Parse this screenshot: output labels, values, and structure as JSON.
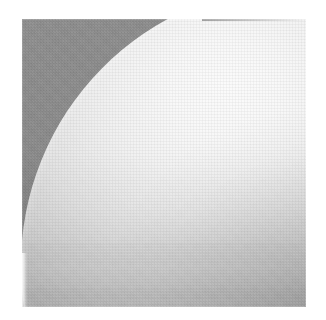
{
  "image": {
    "subject": "sphere",
    "caption": "",
    "medium": "halftone-print-scan",
    "frame": {
      "left_px": 22,
      "top_px": 19,
      "width_px": 284,
      "height_px": 288
    },
    "canvas": {
      "width_px": 326,
      "height_px": 320,
      "background_color": "#ffffff"
    },
    "palette": {
      "page_white": "#ffffff",
      "backdrop_gray": "#8c8c8c",
      "backdrop_gray_dark": "#868686",
      "highlight_white": "#fbfbfb",
      "midtone_light": "#d7d7d7",
      "shadow_gray": "#a4a4a4"
    },
    "lighting": {
      "key_light_position": "upper-right",
      "terminator_direction": "lower-right",
      "highlight_center_pct": [
        40,
        17
      ]
    },
    "sphere": {
      "center_x_px": 284,
      "center_y_px": 278,
      "radius_px": 280,
      "rotation_deg": -6
    },
    "texture": {
      "halftone_opacity": 0.3,
      "grain_opacity": 0.16
    }
  }
}
